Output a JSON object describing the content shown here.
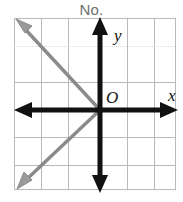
{
  "title": "No.",
  "graph": {
    "origin_label": "O",
    "x_axis_label": "x",
    "y_axis_label": "y",
    "axis_color": "#111111",
    "grid_color": "#b9b9b9",
    "grid_color_light": "#d8d8d8",
    "line_color": "#8a8a8a",
    "background": "#ffffff",
    "grid": {
      "left": 14,
      "top": 18,
      "right": 176,
      "bottom": 190,
      "columns": 6,
      "rows": 6,
      "cell_width": 27,
      "cell_height": 28.7,
      "vertical_lines": [
        14,
        41,
        68,
        100,
        127,
        154,
        176
      ],
      "horizontal_lines": [
        18,
        46,
        82,
        110,
        137,
        165,
        190
      ]
    },
    "axes": {
      "origin_x": 100,
      "origin_y": 110,
      "x_axis_start": 15,
      "x_axis_end": 177,
      "y_axis_start": 18,
      "y_axis_end": 192,
      "stroke_width": 5,
      "arrowheads": [
        "left",
        "right",
        "up",
        "down"
      ]
    },
    "lines": [
      {
        "name": "negative-slope-ray",
        "slope": -1,
        "from_x": 100,
        "from_y": 110,
        "to_x": 19,
        "to_y": 23,
        "arrow_at": "end",
        "color": "#8a8a8a",
        "stroke_width": 3.4
      },
      {
        "name": "positive-slope-ray",
        "slope": 1,
        "from_x": 100,
        "from_y": 110,
        "to_x": 21,
        "to_y": 185,
        "arrow_at": "end",
        "color": "#8a8a8a",
        "stroke_width": 3.4
      }
    ]
  }
}
